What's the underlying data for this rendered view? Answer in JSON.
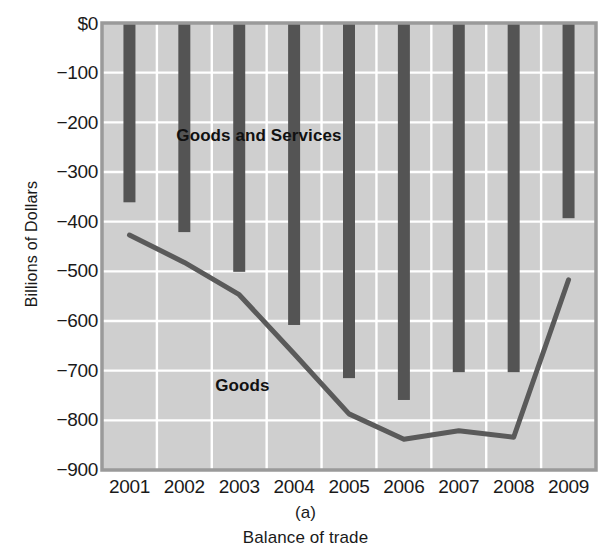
{
  "chart_data": {
    "type": "bar",
    "title": "",
    "subtitle": "",
    "caption": "Balance of trade",
    "panel_label": "(a)",
    "xlabel": "",
    "ylabel": "Billions of Dollars",
    "categories": [
      "2001",
      "2002",
      "2003",
      "2004",
      "2005",
      "2006",
      "2007",
      "2008",
      "2009"
    ],
    "ylim": [
      -900,
      0
    ],
    "ytick_labels": [
      "$0",
      "−100",
      "−200",
      "−300",
      "−400",
      "−500",
      "−600",
      "−700",
      "−800",
      "−900"
    ],
    "ytick_values": [
      0,
      -100,
      -200,
      -300,
      -400,
      -500,
      -600,
      -700,
      -800,
      -900
    ],
    "grid": true,
    "legend_position": "inline-annotation",
    "series": [
      {
        "name": "Goods and Services",
        "render": "bar",
        "values": [
          -361,
          -421,
          -501,
          -608,
          -715,
          -759,
          -703,
          -703,
          -393
        ]
      },
      {
        "name": "Goods",
        "render": "line",
        "values": [
          -427,
          -482,
          -547,
          -666,
          -787,
          -838,
          -821,
          -834,
          -517
        ]
      }
    ],
    "annotations": [
      {
        "text": "Goods and Services",
        "x": "2002",
        "y": -225
      },
      {
        "text": "Goods",
        "x": "2003",
        "y": -728
      }
    ],
    "colors": {
      "plot_background": "#cfcfcf",
      "grid": "#ffffff",
      "bar": "#545454",
      "line": "#5a5a5a",
      "axis_border": "#9a9a9a",
      "text": "#1a1a1a",
      "page_background": "#ffffff"
    }
  }
}
